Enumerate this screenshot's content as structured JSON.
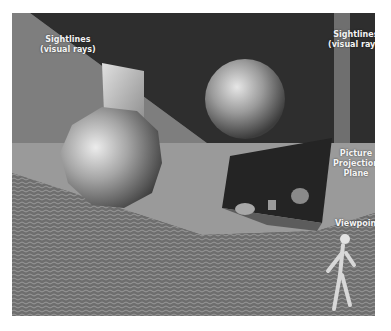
{
  "figure": {
    "labels": {
      "sightlines_left": "Sightlines\n(visual rays)",
      "sightlines_left_line1": "Sightlines",
      "sightlines_left_line2": "(visual rays)",
      "sightlines_right_line1": "Sightlines",
      "sightlines_right_line2": "(visual rays)",
      "plane_line1": "Picture",
      "plane_line2": "Projection",
      "plane_line3": "Plane",
      "viewpoint": "Viewpoint"
    },
    "objects": [
      "rough-sphere-large-left",
      "cube",
      "sphere-back",
      "mannequin-viewer",
      "picture-plane",
      "sightline-cone"
    ],
    "colors": {
      "wall_dark": "#2e2e2e",
      "wall_mid": "#555555",
      "floor_light": "#9c9c9c",
      "floor_texture": "#6f6f6f",
      "ray_band": "#8a8a8a",
      "plane_dark": "#262626",
      "label_text": "#f4f4f4"
    }
  }
}
